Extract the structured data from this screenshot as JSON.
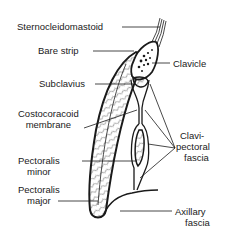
{
  "diagram": {
    "type": "anatomical cross-section",
    "labels_left": [
      {
        "id": "sternocleidomastoid",
        "text": "Sternocleidomastoid"
      },
      {
        "id": "bare_strip",
        "text": "Bare strip"
      },
      {
        "id": "subclavius",
        "text": "Subclavius"
      },
      {
        "id": "costocoracoid_membrane",
        "line1": "Costocoracoid",
        "line2": "membrane"
      },
      {
        "id": "pectoralis_minor",
        "line1": "Pectoralis",
        "line2": "minor"
      },
      {
        "id": "pectoralis_major",
        "line1": "Pectoralis",
        "line2": "major"
      }
    ],
    "labels_right": [
      {
        "id": "clavicle",
        "text": "Clavicle"
      },
      {
        "id": "clavipectoral_fascia",
        "line1": "Clavi-",
        "line2": "pectoral",
        "line3": "fascia"
      },
      {
        "id": "axillary_fascia",
        "line1": "Axillary",
        "line2": "fascia"
      }
    ],
    "colors": {
      "ink": "#1a1a1a",
      "background": "#ffffff"
    }
  }
}
